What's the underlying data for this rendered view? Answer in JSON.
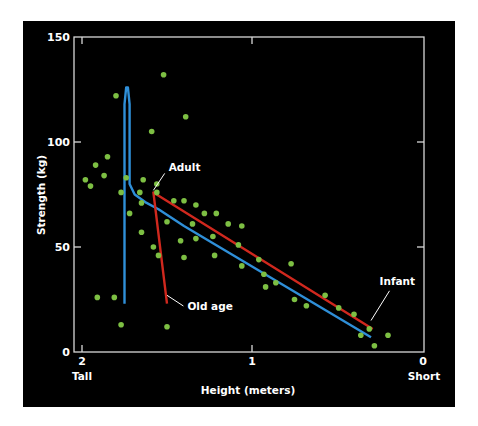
{
  "chart_data": {
    "type": "scatter",
    "title": "",
    "xlabel": "Height (meters)",
    "ylabel": "Strength (kg)",
    "xlim": [
      2,
      0
    ],
    "ylim": [
      0,
      150
    ],
    "x_ticks": [
      "2",
      "1",
      "0"
    ],
    "x_tick_values": [
      2,
      1,
      0
    ],
    "x_end_labels": {
      "left": "Tall",
      "right": "Short"
    },
    "y_ticks": [
      "0",
      "50",
      "100",
      "150"
    ],
    "y_tick_values": [
      0,
      50,
      100,
      150
    ],
    "grid": false,
    "legend": null,
    "colors": {
      "background": "#000000",
      "points": "#7dbf43",
      "axes": "#d8d8d8",
      "text": "#ffffff",
      "blue_line": "#2f8fd8",
      "red_line": "#d0281e"
    },
    "points": [
      {
        "x": 1.52,
        "y": 132
      },
      {
        "x": 1.8,
        "y": 122
      },
      {
        "x": 1.39,
        "y": 112
      },
      {
        "x": 1.59,
        "y": 105
      },
      {
        "x": 1.85,
        "y": 93
      },
      {
        "x": 1.92,
        "y": 89
      },
      {
        "x": 1.98,
        "y": 82
      },
      {
        "x": 1.95,
        "y": 79
      },
      {
        "x": 1.87,
        "y": 84
      },
      {
        "x": 1.74,
        "y": 83
      },
      {
        "x": 1.64,
        "y": 82
      },
      {
        "x": 1.56,
        "y": 80
      },
      {
        "x": 1.77,
        "y": 76
      },
      {
        "x": 1.66,
        "y": 76
      },
      {
        "x": 1.56,
        "y": 76
      },
      {
        "x": 1.46,
        "y": 72
      },
      {
        "x": 1.4,
        "y": 72
      },
      {
        "x": 1.33,
        "y": 70
      },
      {
        "x": 1.21,
        "y": 66
      },
      {
        "x": 1.28,
        "y": 66
      },
      {
        "x": 1.14,
        "y": 61
      },
      {
        "x": 1.06,
        "y": 60
      },
      {
        "x": 1.65,
        "y": 71
      },
      {
        "x": 1.72,
        "y": 66
      },
      {
        "x": 1.5,
        "y": 62
      },
      {
        "x": 1.35,
        "y": 61
      },
      {
        "x": 1.65,
        "y": 57
      },
      {
        "x": 1.33,
        "y": 54
      },
      {
        "x": 1.23,
        "y": 55
      },
      {
        "x": 1.42,
        "y": 53
      },
      {
        "x": 1.08,
        "y": 51
      },
      {
        "x": 1.55,
        "y": 46
      },
      {
        "x": 1.4,
        "y": 45
      },
      {
        "x": 1.22,
        "y": 46
      },
      {
        "x": 0.96,
        "y": 44
      },
      {
        "x": 1.06,
        "y": 41
      },
      {
        "x": 0.93,
        "y": 37
      },
      {
        "x": 0.77,
        "y": 42
      },
      {
        "x": 0.86,
        "y": 33
      },
      {
        "x": 0.92,
        "y": 31
      },
      {
        "x": 0.75,
        "y": 25
      },
      {
        "x": 0.57,
        "y": 27
      },
      {
        "x": 0.68,
        "y": 22
      },
      {
        "x": 0.4,
        "y": 18
      },
      {
        "x": 0.49,
        "y": 21
      },
      {
        "x": 0.31,
        "y": 11
      },
      {
        "x": 0.36,
        "y": 8
      },
      {
        "x": 0.2,
        "y": 8
      },
      {
        "x": 0.28,
        "y": 3
      },
      {
        "x": 1.81,
        "y": 26
      },
      {
        "x": 1.91,
        "y": 26
      },
      {
        "x": 1.77,
        "y": 13
      },
      {
        "x": 1.5,
        "y": 12
      },
      {
        "x": 1.58,
        "y": 50
      }
    ],
    "curves": [
      {
        "name": "blue-growth-curve",
        "color": "#2f8fd8",
        "points": [
          [
            1.75,
            23
          ],
          [
            1.75,
            118
          ],
          [
            1.74,
            126
          ],
          [
            1.73,
            126
          ],
          [
            1.72,
            118
          ],
          [
            1.72,
            80
          ],
          [
            1.69,
            75
          ],
          [
            1.62,
            71
          ],
          [
            1.55,
            68
          ],
          [
            1.4,
            60
          ],
          [
            0.3,
            7
          ]
        ]
      },
      {
        "name": "red-aging-curve",
        "color": "#d0281e",
        "points": [
          [
            0.29,
            11
          ],
          [
            1.58,
            76
          ],
          [
            1.5,
            23
          ]
        ]
      }
    ],
    "annotations": [
      {
        "text": "Adult",
        "x": 1.49,
        "y": 86,
        "pointer_to": [
          1.58,
          77
        ]
      },
      {
        "text": "Old age",
        "x": 1.38,
        "y": 20,
        "pointer_to": [
          1.5,
          27
        ]
      },
      {
        "text": "Infant",
        "x": 0.25,
        "y": 32,
        "pointer_to": [
          0.3,
          15
        ]
      }
    ]
  }
}
